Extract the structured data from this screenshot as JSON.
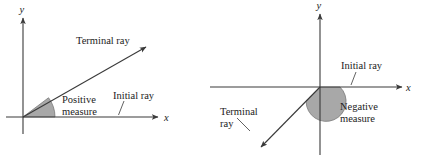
{
  "figure": {
    "width": 421,
    "height": 159,
    "background": "#ffffff",
    "stroke_color": "#3a3a3a",
    "sector_fill": "#a8a8a8",
    "sector_stroke": "#6e6e6e",
    "text_color": "#1c1c1c"
  },
  "panels": [
    {
      "id": "positive-angle",
      "axis_x_label": "x",
      "axis_y_label": "y",
      "labels": {
        "terminal_ray": "Terminal ray",
        "measure_line1": "Positive",
        "measure_line2": "measure",
        "initial_ray": "Initial ray"
      },
      "geometry": {
        "origin_x": 23,
        "origin_y": 117,
        "x_axis_end": 163,
        "y_axis_top": 18,
        "terminal_ray_end_x": 150,
        "terminal_ray_end_y": 44,
        "terminal_ray_angle_deg": 37,
        "sector_radius": 32,
        "sector_start_deg": 0,
        "sector_end_deg": 37
      }
    },
    {
      "id": "negative-angle",
      "axis_x_label": "x",
      "axis_y_label": "y",
      "labels": {
        "initial_ray": "Initial ray",
        "measure_line1": "Negative",
        "measure_line2": "measure",
        "terminal_ray_line1": "Terminal",
        "terminal_ray_line2": "ray"
      },
      "geometry": {
        "origin_x": 110,
        "origin_y": 87,
        "x_axis_start": -10,
        "x_axis_end": 197,
        "y_axis_top": 14,
        "y_axis_bottom": 155,
        "terminal_ray_end_x": 48,
        "terminal_ray_end_y": 150,
        "terminal_ray_angle_deg": 226,
        "sector_radius": 20,
        "sector_start_deg": 0,
        "sector_end_deg": -226
      }
    }
  ]
}
